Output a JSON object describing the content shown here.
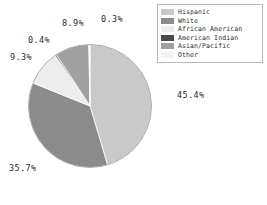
{
  "chart_data": {
    "type": "pie",
    "title": "",
    "categories": [
      "Hispanic",
      "White",
      "African American",
      "American Indian",
      "Asian/Pacific",
      "Other"
    ],
    "values": [
      45.4,
      35.7,
      9.3,
      0.4,
      8.9,
      0.3
    ],
    "labels": [
      "45.4%",
      "35.7%",
      "9.3%",
      "0.4%",
      "8.9%",
      "0.3%"
    ],
    "colors": [
      "#c9c9c9",
      "#8b8b8b",
      "#ededed",
      "#4a4a4a",
      "#a0a0a0",
      "#f2f2f2"
    ],
    "legend_position": "top-right",
    "grid": false,
    "start_angle_deg": 0,
    "direction": "clockwise"
  },
  "legend": {
    "items": [
      {
        "label": "Hispanic",
        "color": "#c9c9c9"
      },
      {
        "label": "White",
        "color": "#8b8b8b"
      },
      {
        "label": "African American",
        "color": "#ededed"
      },
      {
        "label": "American Indian",
        "color": "#4a4a4a"
      },
      {
        "label": "Asian/Pacific",
        "color": "#a0a0a0"
      },
      {
        "label": "Other",
        "color": "#f2f2f2"
      }
    ]
  }
}
